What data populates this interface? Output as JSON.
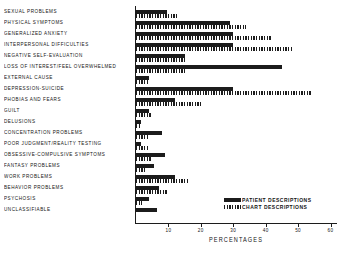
{
  "chart_data": {
    "type": "bar",
    "orientation": "horizontal",
    "title": "",
    "xlabel": "PERCENTAGES",
    "ylabel": "",
    "xlim": [
      0,
      62
    ],
    "xticks": [
      10,
      20,
      30,
      40,
      50,
      60
    ],
    "xticklabels": [
      "10",
      "20",
      "30",
      "40",
      "50",
      "60"
    ],
    "grid": false,
    "legend_position": "inside-lower-right",
    "categories": [
      "SEXUAL PROBLEMS",
      "PHYSICAL SYMPTOMS",
      "GENERALIZED ANXIETY",
      "INTERPERSONAL DIFFICULTIES",
      "NEGATIVE SELF-EVALUATION",
      "LOSS OF INTEREST/FEEL OVERWHELMED",
      "EXTERNAL CAUSE",
      "DEPRESSION-SUICIDE",
      "PHOBIAS AND FEARS",
      "GUILT",
      "DELUSIONS",
      "CONCENTRATION PROBLEMS",
      "POOR JUDGMENT/REALITY TESTING",
      "OBSESSIVE-COMPULSIVE SYMPTOMS",
      "FANTASY PROBLEMS",
      "WORK PROBLEMS",
      "BEHAVIOR PROBLEMS",
      "PSYCHOSIS",
      "UNCLASSIFIABLE"
    ],
    "series": [
      {
        "name": "PATIENT DESCRIPTIONS",
        "color": "#1c1c1c",
        "pattern": "solid",
        "values": [
          9.5,
          29,
          30,
          30,
          15,
          45,
          4,
          30,
          12,
          4,
          1.5,
          8,
          1.5,
          9,
          5.5,
          12,
          7,
          4,
          6.5
        ]
      },
      {
        "name": "CHART DESCRIPTIONS",
        "color": "#1c1c1c",
        "pattern": "vertical-hatch",
        "values": [
          13,
          34,
          42,
          48,
          15,
          15,
          4,
          54,
          20,
          5,
          1.5,
          4,
          4,
          5,
          3,
          16,
          10,
          2,
          0
        ]
      }
    ]
  },
  "legend": {
    "items": [
      {
        "label": "PATIENT DESCRIPTIONS",
        "pattern": "solid"
      },
      {
        "label": "CHART DESCRIPTIONS",
        "pattern": "vertical-hatch"
      }
    ]
  }
}
